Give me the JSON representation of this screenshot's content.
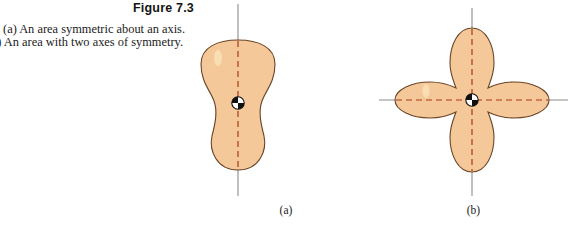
{
  "figure": {
    "title": "Figure 7.3",
    "caption_lines": [
      "(a) An area symmetric about an axis.",
      "(b) An area with two axes of symmetry."
    ],
    "panels": [
      {
        "label": "(a)",
        "shape_name": "peanut-shaped-area",
        "description": "An area symmetric about an axis",
        "axes_of_symmetry": 1,
        "axis_orientations": [
          "vertical"
        ],
        "has_centroid_marker": true
      },
      {
        "label": "(b)",
        "shape_name": "four-petal-area",
        "description": "An area with two axes of symmetry",
        "axes_of_symmetry": 2,
        "axis_orientations": [
          "vertical",
          "horizontal"
        ],
        "has_centroid_marker": true
      }
    ]
  },
  "colors": {
    "shape_fill": "#f5c89a",
    "shape_outline": "#6b4526",
    "symmetry_axis_dash": "#a83a14",
    "reference_axis_line": "#8b8b8b",
    "page_background": "#ffffff",
    "text": "#1b1b1b"
  }
}
